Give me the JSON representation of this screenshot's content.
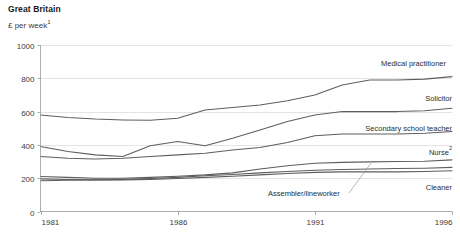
{
  "header": {
    "title": "Great Britain",
    "subtitle": "£ per week",
    "subtitle_footnote": "1"
  },
  "chart_data": {
    "type": "line",
    "title": "Great Britain",
    "subtitle": "£ per week¹",
    "xlabel": "",
    "ylabel": "£ per week",
    "xlim": [
      1981,
      1996
    ],
    "ylim": [
      0,
      1000
    ],
    "yticks": [
      0,
      200,
      400,
      600,
      800,
      1000
    ],
    "ytick_labels": [
      "0",
      "200",
      "400",
      "600",
      "800",
      "1000"
    ],
    "xticks": [
      1981,
      1986,
      1991,
      1996
    ],
    "xtick_labels": [
      "1981",
      "1986",
      "1991",
      "1996"
    ],
    "grid": true,
    "grid_axis": "y",
    "legend_position": "inline-right",
    "x": [
      1981,
      1982,
      1983,
      1984,
      1985,
      1986,
      1987,
      1988,
      1989,
      1990,
      1991,
      1992,
      1993,
      1994,
      1995,
      1996
    ],
    "series": [
      {
        "name": "Medical practitioner",
        "label": "Medical practitioner",
        "footnote": "",
        "values": [
          580,
          565,
          555,
          550,
          548,
          560,
          610,
          625,
          640,
          665,
          700,
          760,
          790,
          790,
          795,
          810
        ]
      },
      {
        "name": "Solicitor",
        "label": "Solicitor",
        "footnote": "",
        "values": [
          390,
          360,
          340,
          330,
          395,
          420,
          395,
          440,
          490,
          540,
          580,
          600,
          600,
          600,
          605,
          620
        ]
      },
      {
        "name": "Secondary school teacher",
        "label": "Secondary school teacher",
        "footnote": "",
        "values": [
          330,
          320,
          315,
          320,
          330,
          340,
          350,
          370,
          385,
          415,
          455,
          465,
          465,
          465,
          470,
          480
        ]
      },
      {
        "name": "Nurse",
        "label": "Nurse",
        "footnote": "2",
        "values": [
          210,
          205,
          200,
          200,
          205,
          212,
          220,
          232,
          255,
          275,
          290,
          295,
          298,
          300,
          302,
          310
        ]
      },
      {
        "name": "Assembler/lineworker",
        "label": "Assembler/lineworker",
        "footnote": "",
        "values": [
          185,
          188,
          190,
          193,
          198,
          205,
          215,
          222,
          232,
          240,
          248,
          252,
          255,
          258,
          260,
          265
        ]
      },
      {
        "name": "Cleaner",
        "label": "Cleaner",
        "footnote": "",
        "values": [
          196,
          192,
          190,
          190,
          193,
          198,
          205,
          212,
          220,
          228,
          235,
          238,
          238,
          238,
          240,
          245
        ]
      }
    ],
    "colors": {
      "line": "#5e5e5e",
      "grid": "#d9d9d9",
      "axis": "#9a9a9a",
      "text": "#2b2b2b",
      "background": "#ffffff"
    }
  }
}
